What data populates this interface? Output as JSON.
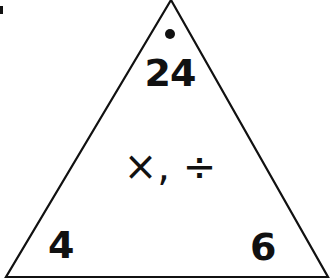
{
  "triangle": {
    "top_value": "24",
    "bottom_left_value": "4",
    "bottom_right_value": "6",
    "operations": "×, ÷",
    "stroke_color": "#111111",
    "background": "#ffffff"
  }
}
